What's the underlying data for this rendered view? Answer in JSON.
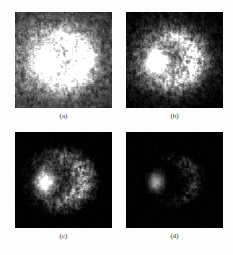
{
  "figure": {
    "type": "image-panel-grid",
    "background_color": "#fdfdfd",
    "panel_background_color": "#000000",
    "caption_color": "#2a2a2a",
    "columns": 2,
    "rows": 2,
    "panels": [
      {
        "id": "a",
        "caption": "(a)",
        "description": "grayscale speckle image, brightest overall, large saturated white blob left of center with crescent ring and dense bright background texture",
        "brightness": 1.0,
        "threshold": 0.0,
        "core_gain": 1.0,
        "background_gain": 1.0,
        "seed": 11
      },
      {
        "id": "b",
        "caption": "(b)",
        "description": "grayscale speckle image, higher contrast thresholded texture, bright blob left with segmented ring structures to the right",
        "brightness": 0.82,
        "threshold": 0.14,
        "core_gain": 1.05,
        "background_gain": 0.72,
        "seed": 23
      },
      {
        "id": "c",
        "caption": "(c)",
        "description": "grayscale speckle image, darker background, bright ring and cluster structures concentrated near center",
        "brightness": 0.62,
        "threshold": 0.3,
        "core_gain": 1.0,
        "background_gain": 0.42,
        "seed": 37
      },
      {
        "id": "d",
        "caption": "(d)",
        "description": "grayscale speckle image, darkest, only a small bright cluster remains near center on a near-black field",
        "brightness": 0.42,
        "threshold": 0.5,
        "core_gain": 0.92,
        "background_gain": 0.18,
        "seed": 53
      }
    ]
  }
}
